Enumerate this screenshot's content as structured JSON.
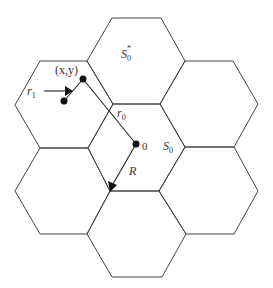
{
  "diagram": {
    "cells": [
      {
        "id": "top",
        "label": "S",
        "sub": "0",
        "sup": "*"
      },
      {
        "id": "upper-left",
        "label": ""
      },
      {
        "id": "upper-right",
        "label": ""
      },
      {
        "id": "center",
        "label": "S",
        "sub": "0"
      },
      {
        "id": "lower-left",
        "label": ""
      },
      {
        "id": "lower-right",
        "label": ""
      },
      {
        "id": "bottom",
        "label": ""
      }
    ],
    "labels": {
      "point": "(x,y)",
      "r1_main": "r",
      "r1_sub": "1",
      "r0_main": "r",
      "r0_sub": "0",
      "origin": "0",
      "radius": "R",
      "s0_main": "S",
      "s0_sub": "0",
      "s0star_main": "S",
      "s0star_sub": "0",
      "s0star_sup": "*"
    },
    "colors": {
      "stroke": "#444444",
      "dot": "#111111",
      "text": "#333333"
    }
  }
}
